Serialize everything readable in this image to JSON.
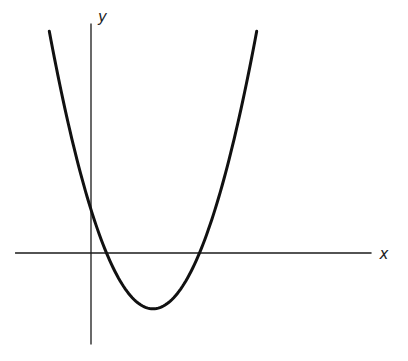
{
  "chart_data": {
    "type": "line",
    "title": "",
    "xlabel": "x",
    "ylabel": "y",
    "function": "y = a(x - r1)(x - r2)",
    "a": 0.4,
    "roots": [
      1,
      7
    ],
    "vertex": [
      4,
      -3.6
    ],
    "y_intercept": 2.8,
    "xlim": [
      -4.9,
      18.1
    ],
    "ylim": [
      -5.9,
      14.8
    ],
    "x_domain_drawn": [
      -2.69,
      10.69
    ],
    "grid": false,
    "ticks": false,
    "series": [
      {
        "name": "parabola",
        "color": "#111111"
      }
    ]
  },
  "labels": {
    "x_axis": "x",
    "y_axis": "y"
  }
}
